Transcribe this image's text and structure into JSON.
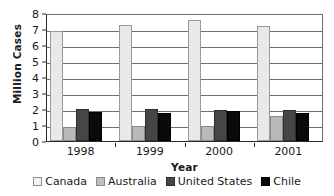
{
  "chart_data": {
    "type": "bar",
    "title": "",
    "xlabel": "Year",
    "ylabel": "Million Cases",
    "categories": [
      "1998",
      "1999",
      "2000",
      "2001"
    ],
    "series": [
      {
        "name": "Canada",
        "color": "#e9e9e9",
        "values": [
          6.85,
          7.25,
          7.55,
          7.2
        ]
      },
      {
        "name": "Australia",
        "color": "#b9b9b9",
        "values": [
          0.85,
          0.95,
          0.95,
          1.55
        ]
      },
      {
        "name": "United States",
        "color": "#464646",
        "values": [
          2.0,
          2.0,
          1.95,
          1.95
        ]
      },
      {
        "name": "Chile",
        "color": "#0a0a0a",
        "values": [
          1.8,
          1.78,
          1.85,
          1.75
        ]
      }
    ],
    "ylim": [
      0,
      8
    ],
    "yticks": [
      "0",
      "1",
      "2",
      "3",
      "4",
      "5",
      "6",
      "7",
      "8"
    ],
    "grid": true,
    "legend_position": "bottom"
  },
  "legend": {
    "items": [
      {
        "label": "Canada"
      },
      {
        "label": "Australia"
      },
      {
        "label": "United States"
      },
      {
        "label": "Chile"
      }
    ]
  }
}
